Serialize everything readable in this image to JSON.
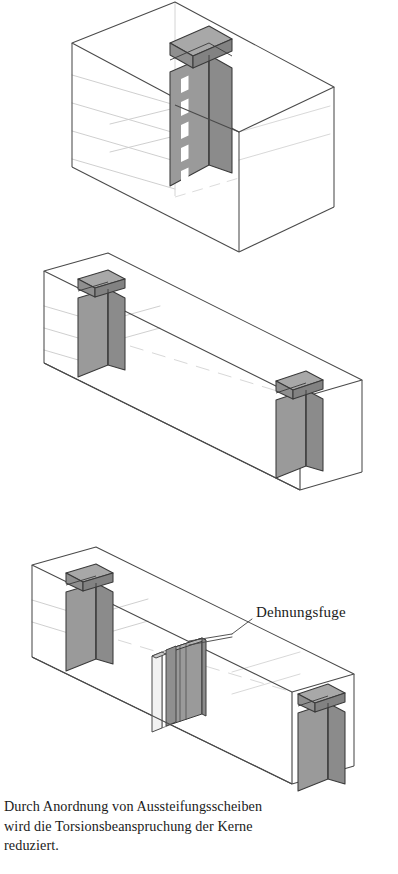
{
  "document": {
    "language": "de",
    "kind": "technical-illustration",
    "subject": "Aussteifung von Gebaeuden - Kerne und Aussteifungsscheiben"
  },
  "palette": {
    "page_background": "#ffffff",
    "core_front_face": "#9a9a9a",
    "core_side_face": "#8b8b8b",
    "core_top_face": "#a8a8a8",
    "core_cap_front": "#8f8f8f",
    "core_cap_side": "#828282",
    "core_opening": "#ffffff",
    "outline_strong": "#3a3a3a",
    "outline_medium": "#6b6b6b",
    "outline_faint": "#c9c9c9",
    "outline_hidden": "#d4d4d4",
    "text": "#1a1a1a"
  },
  "diagrams": [
    {
      "id": "diagram-1",
      "name": "single-core-compact-building",
      "description": "Kompakter Baukoerper mit einem zentralen Kern",
      "volume": {
        "shape": "isometric-box",
        "transparent": true,
        "floor_lines": 4
      },
      "cores": [
        {
          "label": "Kern",
          "position": "mitte",
          "has_cap": true,
          "openings": 5,
          "opening_color": "#ffffff"
        }
      ]
    },
    {
      "id": "diagram-2",
      "name": "elongated-building-two-cores",
      "description": "Langgestreckter Baukoerper mit zwei Kernen",
      "volume": {
        "shape": "isometric-box-elongated",
        "transparent": true,
        "floor_lines": 3
      },
      "cores": [
        {
          "label": "Kern links",
          "position": "links",
          "has_cap": true,
          "openings": 0
        },
        {
          "label": "Kern rechts",
          "position": "rechts",
          "has_cap": true,
          "openings": 0
        }
      ]
    },
    {
      "id": "diagram-3",
      "name": "elongated-building-two-cores-with-shear-walls",
      "description": "Langgestreckter Baukoerper mit zwei Kernen und Aussteifungsscheiben an der Dehnungsfuge",
      "volume": {
        "shape": "isometric-box-elongated",
        "transparent": true,
        "floor_lines": 3
      },
      "cores": [
        {
          "label": "Kern links",
          "position": "links",
          "has_cap": true,
          "openings": 0
        },
        {
          "label": "Kern rechts",
          "position": "rechts",
          "has_cap": true,
          "openings": 0
        }
      ],
      "shear_walls": {
        "label": "Aussteifungsscheiben",
        "count": 2,
        "position": "mitte",
        "joint_between": true
      }
    }
  ],
  "annotations": {
    "callout": {
      "label": "Dehnungsfuge",
      "leader_line": true,
      "points_to": "shear-walls-middle"
    }
  },
  "caption": {
    "text": "Durch Anordnung von Aussteifungsscheiben\nwird die Torsionsbeanspruchung der Kerne\nreduziert.",
    "lines": [
      "Durch Anordnung von Aussteifungsscheiben",
      "wird die Torsionsbeanspruchung der Kerne",
      "reduziert."
    ]
  }
}
